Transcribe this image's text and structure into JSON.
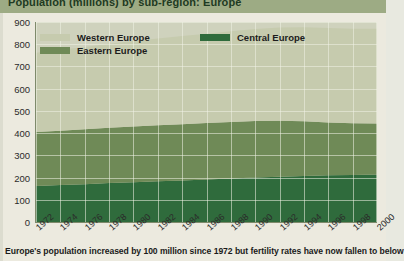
{
  "title": "Population (millions) by sub-region: Europe",
  "caption": "Europe's population increased by 100 million since 1972 but fertility rates have now fallen to below",
  "legend": {
    "position": "top-left",
    "items": [
      {
        "label": "Western Europe",
        "color": "#c6cbae"
      },
      {
        "label": "Central Europe",
        "color": "#2f6b3c"
      },
      {
        "label": "Eastern Europe",
        "color": "#6f8a57"
      }
    ]
  },
  "colors": {
    "title_bar": "#9dab84",
    "plot_background": "#cfd2bd",
    "western": "#c6cbae",
    "eastern": "#6f8a57",
    "central": "#2f6b3c",
    "gridline": "#f0f2e6",
    "axis": "#7e8a6b",
    "page": "#eceadf"
  },
  "axes": {
    "y": {
      "label": "",
      "min": 0,
      "max": 900,
      "step": 100,
      "ticks": [
        "0",
        "100",
        "200",
        "300",
        "400",
        "500",
        "600",
        "700",
        "800",
        "900"
      ]
    },
    "x": {
      "label": "",
      "ticks": [
        "1972",
        "1974",
        "1976",
        "1978",
        "1980",
        "1982",
        "1984",
        "1986",
        "1988",
        "1990",
        "1992",
        "1994",
        "1996",
        "1998",
        "2000"
      ]
    }
  },
  "chart_data": {
    "type": "area",
    "stacked": true,
    "title": "Population (millions) by sub-region: Europe",
    "xlabel": "",
    "ylabel": "Population (millions)",
    "ylim": [
      0,
      900
    ],
    "xlim": [
      1972,
      2000
    ],
    "grid": true,
    "legend_position": "top-left",
    "x": [
      1972,
      1974,
      1976,
      1978,
      1980,
      1982,
      1984,
      1986,
      1988,
      1990,
      1992,
      1994,
      1996,
      1998,
      2000
    ],
    "series": [
      {
        "name": "Central Europe",
        "color": "#2f6b3c",
        "values": [
          162,
          166,
          170,
          175,
          179,
          183,
          187,
          191,
          196,
          200,
          204,
          207,
          210,
          212,
          214
        ]
      },
      {
        "name": "Eastern Europe",
        "color": "#6f8a57",
        "values": [
          243,
          245,
          247,
          249,
          251,
          252,
          253,
          254,
          254,
          254,
          252,
          246,
          238,
          232,
          229
        ]
      },
      {
        "name": "Western Europe",
        "color": "#c6cbae",
        "values": [
          357,
          364,
          371,
          378,
          385,
          391,
          397,
          402,
          408,
          414,
          419,
          423,
          425,
          426,
          427
        ]
      }
    ],
    "totals": [
      762,
      775,
      788,
      802,
      815,
      826,
      837,
      847,
      858,
      868,
      875,
      876,
      873,
      870,
      870
    ],
    "annotations": [
      "Europe's population increased by 100 million since 1972"
    ]
  }
}
